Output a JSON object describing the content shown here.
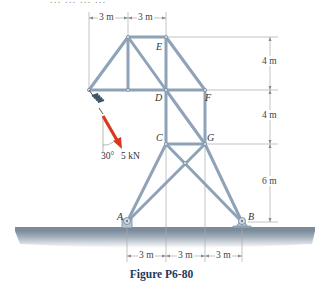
{
  "figure": {
    "caption": "Figure P6-80",
    "cut_off_top_text": "... ... ... ...",
    "joints": {
      "A": "A",
      "B": "B",
      "C": "C",
      "D": "D",
      "E": "E",
      "F": "F",
      "G": "G"
    },
    "load": {
      "angle_label": "30°",
      "magnitude_label": "5 kN",
      "color": "#d9381e"
    },
    "top_dimensions": [
      "3 m",
      "3 m"
    ],
    "right_dimensions": [
      "4 m",
      "4 m",
      "6 m"
    ],
    "bottom_dimensions": [
      "3 m",
      "3 m",
      "3 m"
    ],
    "colors": {
      "member": "#8fa3b8",
      "member_dark": "#6f8296",
      "ground": "#9aa8b5",
      "dim_line": "#9a9a9a",
      "caption": "#1f3a5a"
    }
  }
}
